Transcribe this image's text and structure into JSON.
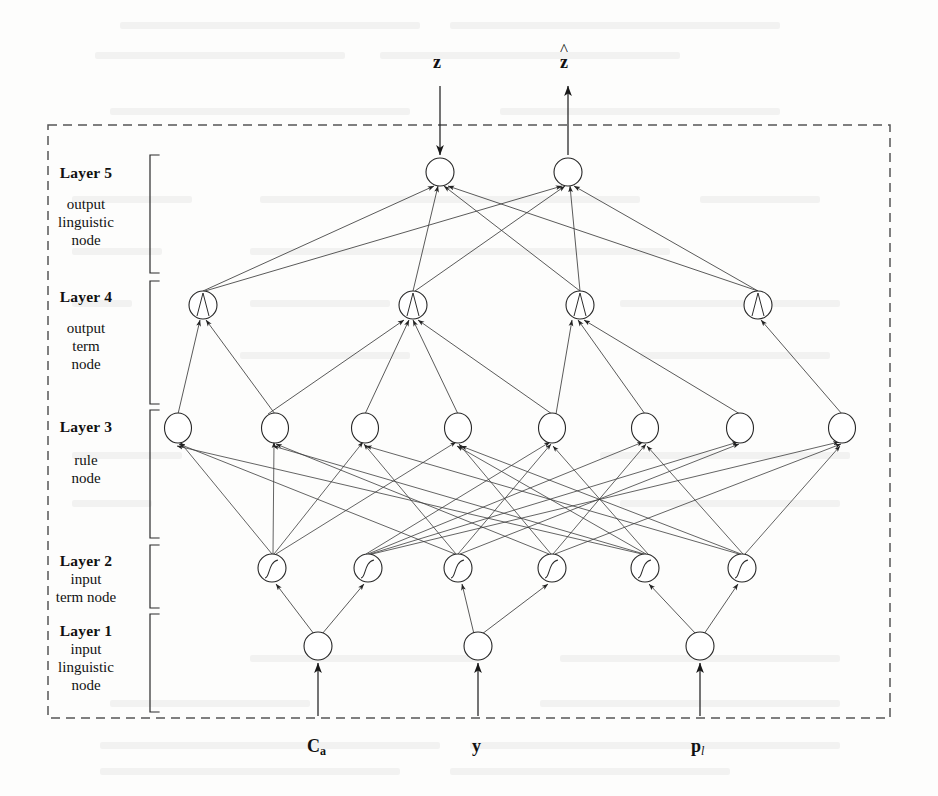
{
  "figure": {
    "kind": "five-layer-neuro-fuzzy-network-diagram",
    "border_style": "dashed",
    "colors": {
      "ink": "#1a1a1a",
      "line": "#3c3c3c",
      "border": "#555555",
      "background": "#fdfdfc"
    }
  },
  "inputs": {
    "top_input": {
      "label": "z",
      "direction": "down",
      "node_index": 0
    },
    "top_output": {
      "label": "z",
      "accent": "hat",
      "direction": "up",
      "node_index": 1
    },
    "bottom": [
      {
        "label": "C",
        "subscript": "a",
        "subscript_style": "bold",
        "direction": "up"
      },
      {
        "label": "y",
        "subscript": "",
        "subscript_style": "none",
        "direction": "up"
      },
      {
        "label": "p",
        "subscript": "l",
        "subscript_style": "italic",
        "direction": "up"
      }
    ]
  },
  "layers": [
    {
      "id": "layer5",
      "title": "Layer 5",
      "description": [
        "output",
        "linguistic",
        "node"
      ],
      "node_count": 2,
      "node_glyph": "plain-circle"
    },
    {
      "id": "layer4",
      "title": "Layer 4",
      "description": [
        "output",
        "term",
        "node"
      ],
      "node_count": 4,
      "node_glyph": "triangular-membership"
    },
    {
      "id": "layer3",
      "title": "Layer 3",
      "description": [
        "rule",
        "node"
      ],
      "node_count": 8,
      "node_glyph": "plain-circle"
    },
    {
      "id": "layer2",
      "title": "Layer 2",
      "description": [
        "input",
        "term node"
      ],
      "node_count": 6,
      "node_glyph": "sigmoid-membership"
    },
    {
      "id": "layer1",
      "title": "Layer 1",
      "description": [
        "input",
        "linguistic",
        "node"
      ],
      "node_count": 3,
      "node_glyph": "plain-circle"
    }
  ],
  "geometry": {
    "border": {
      "x": 48,
      "y": 125,
      "width": 842,
      "height": 593
    },
    "bracket_x": 150,
    "bracket_tick": 9,
    "node_radius": 14,
    "layer_rows": [
      {
        "id": "layer5",
        "cy": 172,
        "xs": [
          440,
          568
        ]
      },
      {
        "id": "layer4",
        "cy": 305,
        "xs": [
          203,
          413,
          580,
          758
        ]
      },
      {
        "id": "layer3",
        "cy": 428,
        "xs": [
          178,
          275,
          365,
          458,
          552,
          645,
          740,
          842
        ]
      },
      {
        "id": "layer2",
        "cy": 568,
        "xs": [
          272,
          368,
          458,
          552,
          645,
          742
        ]
      },
      {
        "id": "layer1",
        "cy": 646,
        "xs": [
          318,
          478,
          700
        ]
      }
    ],
    "bracket_rows": [
      {
        "id": "layer5",
        "top": 155,
        "bottom": 273
      },
      {
        "id": "layer4",
        "top": 281,
        "bottom": 404
      },
      {
        "id": "layer3",
        "top": 410,
        "bottom": 538
      },
      {
        "id": "layer2",
        "top": 545,
        "bottom": 608
      },
      {
        "id": "layer1",
        "top": 614,
        "bottom": 712
      }
    ]
  },
  "connections": {
    "layer1_to_layer2": [
      [
        0,
        0
      ],
      [
        0,
        1
      ],
      [
        1,
        2
      ],
      [
        1,
        3
      ],
      [
        2,
        4
      ],
      [
        2,
        5
      ]
    ],
    "layer2_to_layer3": [
      [
        0,
        0
      ],
      [
        0,
        1
      ],
      [
        0,
        2
      ],
      [
        0,
        3
      ],
      [
        1,
        4
      ],
      [
        1,
        5
      ],
      [
        1,
        6
      ],
      [
        1,
        7
      ],
      [
        2,
        0
      ],
      [
        2,
        2
      ],
      [
        2,
        4
      ],
      [
        2,
        6
      ],
      [
        3,
        1
      ],
      [
        3,
        3
      ],
      [
        3,
        5
      ],
      [
        3,
        7
      ],
      [
        4,
        0
      ],
      [
        4,
        1
      ],
      [
        4,
        4
      ],
      [
        4,
        5
      ],
      [
        5,
        2
      ],
      [
        5,
        3
      ],
      [
        5,
        6
      ],
      [
        5,
        7
      ]
    ],
    "layer3_to_layer4": [
      [
        0,
        0
      ],
      [
        1,
        0
      ],
      [
        2,
        1
      ],
      [
        3,
        1
      ],
      [
        4,
        1
      ],
      [
        5,
        2
      ],
      [
        6,
        2
      ],
      [
        7,
        3
      ],
      [
        1,
        1
      ],
      [
        4,
        2
      ],
      [
        2,
        0
      ],
      [
        5,
        1
      ]
    ],
    "layer4_to_layer5": [
      [
        0,
        0
      ],
      [
        0,
        1
      ],
      [
        1,
        0
      ],
      [
        1,
        1
      ],
      [
        2,
        0
      ],
      [
        2,
        1
      ],
      [
        3,
        0
      ],
      [
        3,
        1
      ]
    ]
  },
  "arrows": {
    "top_input_label": "z",
    "top_output_label": "z",
    "input_arrow_from_y": 88,
    "input_arrow_to_y": 156,
    "bottom_arrow_from_y": 712,
    "bottom_arrow_to_y": 662
  }
}
